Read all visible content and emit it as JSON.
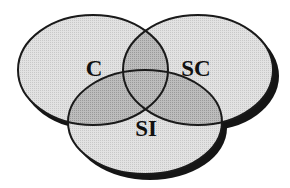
{
  "diagram": {
    "type": "venn",
    "sets": [
      {
        "id": "C",
        "label": "C",
        "cx": 93,
        "cy": 70,
        "rx": 75,
        "ry": 55
      },
      {
        "id": "SC",
        "label": "SC",
        "cx": 198,
        "cy": 70,
        "rx": 75,
        "ry": 55
      },
      {
        "id": "SI",
        "label": "SI",
        "cx": 145,
        "cy": 122,
        "rx": 77,
        "ry": 52
      }
    ],
    "colors": {
      "fill_single": "#dcdcdc",
      "fill_pair": "#b4b4b4",
      "fill_triple": "#a0a0a0",
      "outline": "#1a1a1a",
      "shadow": "#151515",
      "background": "#ffffff"
    }
  }
}
